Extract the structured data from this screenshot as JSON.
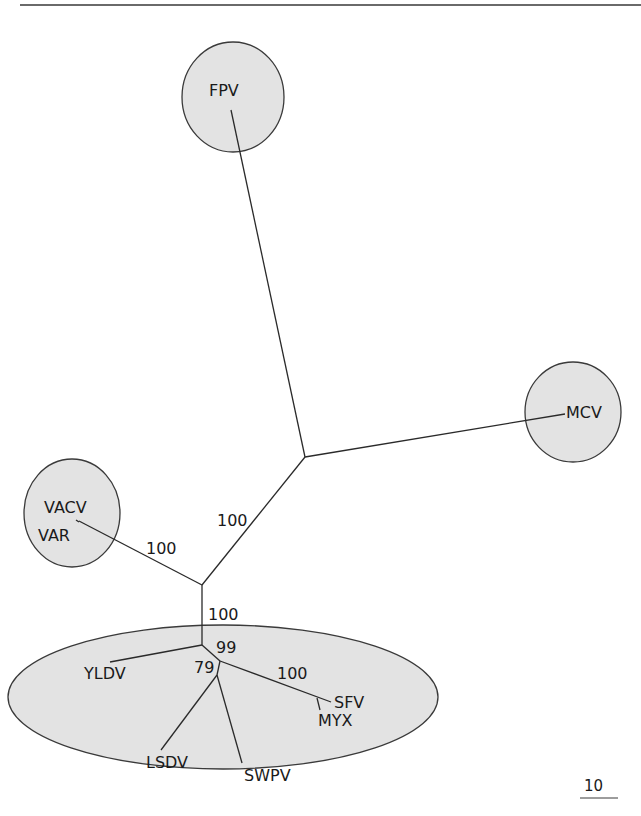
{
  "figure": {
    "type": "unrooted phylogenetic tree",
    "colors": {
      "clade_fill": "#e3e3e3",
      "line": "#2a2a2a",
      "background": "#ffffff"
    },
    "taxa": {
      "fpv": "FPV",
      "mcv": "MCV",
      "vacv": "VACV",
      "var": "VAR",
      "yldv": "YLDV",
      "lsdv": "LSDV",
      "swpv": "SWPV",
      "sfv": "SFV",
      "myx": "MYX"
    },
    "support_values": {
      "central_branch": "100",
      "vacv_var_branch": "100",
      "lower_stem": "100",
      "node_99": "99",
      "node_79": "79",
      "sfv_myx_branch": "100"
    },
    "clades": [
      {
        "name": "FPV clade",
        "members": [
          "FPV"
        ]
      },
      {
        "name": "MCV clade",
        "members": [
          "MCV"
        ]
      },
      {
        "name": "VACV/VAR clade",
        "members": [
          "VACV",
          "VAR"
        ]
      },
      {
        "name": "Lower clade",
        "members": [
          "YLDV",
          "LSDV",
          "SWPV",
          "SFV",
          "MYX"
        ]
      }
    ],
    "scale_bar": {
      "label": "10"
    }
  }
}
